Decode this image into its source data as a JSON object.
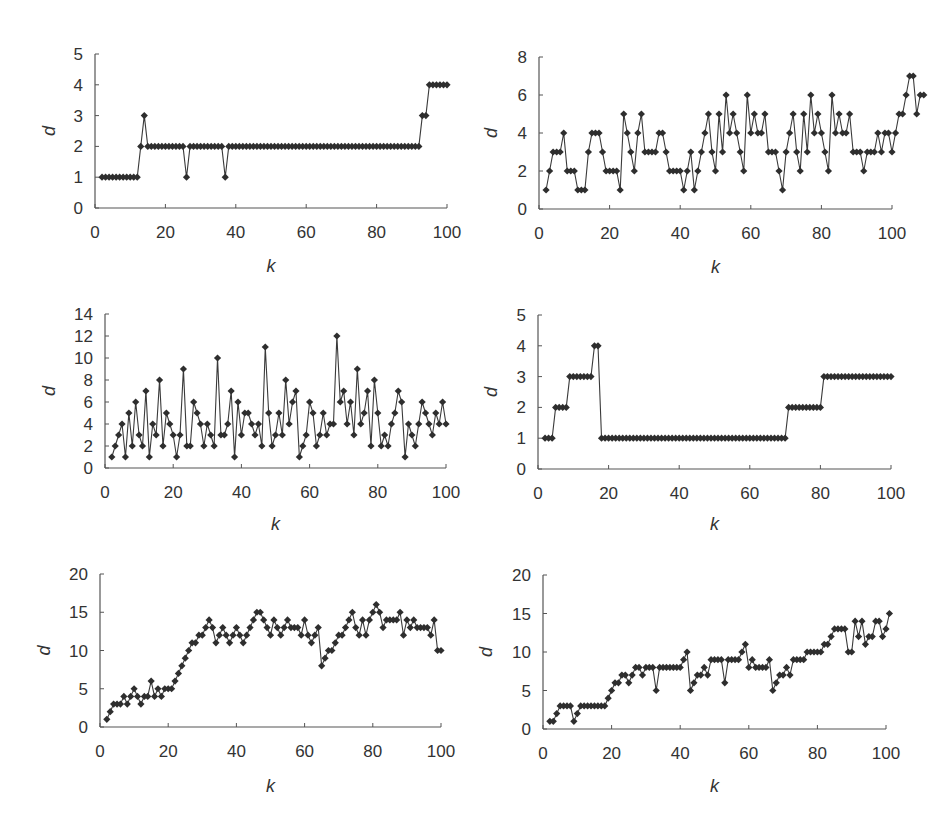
{
  "figure": {
    "background": "#ffffff",
    "line_color": "#3a3a3a",
    "marker_color": "#2e2e2e",
    "axis_color": "#555555"
  },
  "chart_data": [
    {
      "id": "panel-1",
      "type": "line",
      "title": "",
      "xlabel": "k",
      "ylabel": "d",
      "xlim": [
        0,
        100
      ],
      "ylim": [
        0,
        5
      ],
      "xticks": [
        0,
        20,
        40,
        60,
        80,
        100
      ],
      "yticks": [
        0,
        1,
        2,
        3,
        4,
        5
      ],
      "grid": false,
      "legend": null,
      "marker": "diamond",
      "x_start": 2,
      "values": [
        1,
        1,
        1,
        1,
        1,
        1,
        1,
        1,
        1,
        1,
        1,
        2,
        3,
        2,
        2,
        2,
        2,
        2,
        2,
        2,
        2,
        2,
        2,
        2,
        1,
        2,
        2,
        2,
        2,
        2,
        2,
        2,
        2,
        2,
        2,
        1,
        2,
        2,
        2,
        2,
        2,
        2,
        2,
        2,
        2,
        2,
        2,
        2,
        2,
        2,
        2,
        2,
        2,
        2,
        2,
        2,
        2,
        2,
        2,
        2,
        2,
        2,
        2,
        2,
        2,
        2,
        2,
        2,
        2,
        2,
        2,
        2,
        2,
        2,
        2,
        2,
        2,
        2,
        2,
        2,
        2,
        2,
        2,
        2,
        2,
        2,
        2,
        2,
        2,
        2,
        2,
        3,
        3,
        4,
        4,
        4,
        4,
        4,
        4
      ]
    },
    {
      "id": "panel-2",
      "type": "line",
      "title": "",
      "xlabel": "k",
      "ylabel": "d",
      "xlim": [
        0,
        100
      ],
      "ylim": [
        0,
        8
      ],
      "xticks": [
        0,
        20,
        40,
        60,
        80,
        100
      ],
      "yticks": [
        0,
        2,
        4,
        6,
        8
      ],
      "grid": false,
      "legend": null,
      "marker": "diamond",
      "x_start": 2,
      "values": [
        1,
        2,
        3,
        3,
        3,
        4,
        2,
        2,
        2,
        1,
        1,
        1,
        3,
        4,
        4,
        4,
        3,
        2,
        2,
        2,
        2,
        1,
        5,
        4,
        3,
        2,
        4,
        5,
        3,
        3,
        3,
        3,
        4,
        4,
        3,
        2,
        2,
        2,
        2,
        1,
        2,
        3,
        1,
        2,
        3,
        4,
        5,
        3,
        2,
        5,
        3,
        6,
        4,
        5,
        4,
        3,
        2,
        6,
        4,
        5,
        4,
        4,
        5,
        3,
        3,
        3,
        2,
        1,
        3,
        4,
        5,
        3,
        2,
        5,
        3,
        6,
        4,
        5,
        4,
        3,
        2,
        6,
        4,
        5,
        4,
        4,
        5,
        3,
        3,
        3,
        2,
        3,
        3,
        3,
        4,
        3,
        4,
        4,
        3,
        4,
        5,
        5,
        6,
        7,
        7,
        5,
        6,
        6
      ]
    },
    {
      "id": "panel-3",
      "type": "line",
      "title": "",
      "xlabel": "k",
      "ylabel": "d",
      "xlim": [
        0,
        100
      ],
      "ylim": [
        0,
        14
      ],
      "xticks": [
        0,
        20,
        40,
        60,
        80,
        100
      ],
      "yticks": [
        0,
        2,
        4,
        6,
        8,
        10,
        12,
        14
      ],
      "grid": false,
      "legend": null,
      "marker": "diamond",
      "x_start": 2,
      "values": [
        1,
        2,
        3,
        4,
        1,
        5,
        2,
        6,
        3,
        2,
        7,
        1,
        4,
        3,
        8,
        2,
        5,
        4,
        3,
        1,
        3,
        9,
        2,
        2,
        6,
        5,
        4,
        2,
        4,
        3,
        2,
        10,
        3,
        3,
        4,
        7,
        1,
        6,
        3,
        5,
        5,
        4,
        3,
        4,
        2,
        11,
        5,
        2,
        3,
        5,
        3,
        8,
        4,
        6,
        7,
        1,
        2,
        3,
        6,
        5,
        2,
        3,
        5,
        3,
        4,
        4,
        12,
        6,
        7,
        4,
        6,
        3,
        9,
        4,
        5,
        7,
        2,
        8,
        5,
        2,
        3,
        2,
        4,
        5,
        7,
        6,
        1,
        4,
        3,
        2,
        4,
        6,
        5,
        4,
        3,
        5,
        4,
        6,
        4
      ]
    },
    {
      "id": "panel-4",
      "type": "line",
      "title": "",
      "xlabel": "k",
      "ylabel": "d",
      "xlim": [
        0,
        100
      ],
      "ylim": [
        0,
        5
      ],
      "xticks": [
        0,
        20,
        40,
        60,
        80,
        100
      ],
      "yticks": [
        0,
        1,
        2,
        3,
        4,
        5
      ],
      "grid": false,
      "legend": null,
      "marker": "diamond",
      "x_start": 2,
      "values": [
        1,
        1,
        1,
        2,
        2,
        2,
        2,
        3,
        3,
        3,
        3,
        3,
        3,
        3,
        4,
        4,
        1,
        1,
        1,
        1,
        1,
        1,
        1,
        1,
        1,
        1,
        1,
        1,
        1,
        1,
        1,
        1,
        1,
        1,
        1,
        1,
        1,
        1,
        1,
        1,
        1,
        1,
        1,
        1,
        1,
        1,
        1,
        1,
        1,
        1,
        1,
        1,
        1,
        1,
        1,
        1,
        1,
        1,
        1,
        1,
        1,
        1,
        1,
        1,
        1,
        1,
        1,
        1,
        1,
        2,
        2,
        2,
        2,
        2,
        2,
        2,
        2,
        2,
        2,
        3,
        3,
        3,
        3,
        3,
        3,
        3,
        3,
        3,
        3,
        3,
        3,
        3,
        3,
        3,
        3,
        3,
        3,
        3,
        3
      ]
    },
    {
      "id": "panel-5",
      "type": "line",
      "title": "",
      "xlabel": "k",
      "ylabel": "d",
      "xlim": [
        0,
        100
      ],
      "ylim": [
        0,
        20
      ],
      "xticks": [
        0,
        20,
        40,
        60,
        80,
        100
      ],
      "yticks": [
        0,
        5,
        10,
        15,
        20
      ],
      "grid": false,
      "legend": null,
      "marker": "diamond",
      "x_start": 2,
      "values": [
        1,
        2,
        3,
        3,
        3,
        4,
        3,
        4,
        5,
        4,
        3,
        4,
        4,
        6,
        4,
        5,
        4,
        5,
        5,
        5,
        6,
        7,
        8,
        9,
        10,
        11,
        11,
        12,
        12,
        13,
        14,
        13,
        11,
        12,
        13,
        12,
        11,
        12,
        13,
        12,
        11,
        12,
        13,
        14,
        15,
        15,
        14,
        13,
        12,
        14,
        13,
        12,
        13,
        14,
        13,
        13,
        13,
        12,
        14,
        12,
        11,
        12,
        13,
        8,
        9,
        10,
        10,
        11,
        12,
        12,
        13,
        14,
        15,
        13,
        12,
        14,
        12,
        14,
        15,
        16,
        15,
        13,
        14,
        14,
        14,
        14,
        15,
        12,
        14,
        13,
        14,
        13,
        13,
        13,
        13,
        12,
        14,
        10,
        10
      ]
    },
    {
      "id": "panel-6",
      "type": "line",
      "title": "",
      "xlabel": "k",
      "ylabel": "d",
      "xlim": [
        0,
        100
      ],
      "ylim": [
        0,
        20
      ],
      "xticks": [
        0,
        20,
        40,
        60,
        80,
        100
      ],
      "yticks": [
        0,
        5,
        10,
        15,
        20
      ],
      "grid": false,
      "legend": null,
      "marker": "diamond",
      "x_start": 2,
      "values": [
        1,
        1,
        2,
        3,
        3,
        3,
        3,
        1,
        2,
        3,
        3,
        3,
        3,
        3,
        3,
        3,
        3,
        4,
        5,
        6,
        6,
        7,
        7,
        6,
        7,
        8,
        8,
        7,
        8,
        8,
        8,
        5,
        8,
        8,
        8,
        8,
        8,
        8,
        8,
        9,
        10,
        5,
        6,
        7,
        7,
        8,
        7,
        9,
        9,
        9,
        9,
        6,
        9,
        9,
        9,
        9,
        10,
        11,
        8,
        9,
        8,
        8,
        8,
        8,
        9,
        5,
        6,
        7,
        7,
        8,
        7,
        9,
        9,
        9,
        9,
        10,
        10,
        10,
        10,
        10,
        11,
        11,
        12,
        13,
        13,
        13,
        13,
        10,
        10,
        14,
        12,
        14,
        11,
        12,
        12,
        14,
        14,
        12,
        13,
        15
      ]
    }
  ],
  "panels": [
    {
      "xlabel": "k",
      "ylabel": "d"
    },
    {
      "xlabel": "k",
      "ylabel": "d"
    },
    {
      "xlabel": "k",
      "ylabel": "d"
    },
    {
      "xlabel": "k",
      "ylabel": "d"
    },
    {
      "xlabel": "k",
      "ylabel": "d"
    },
    {
      "xlabel": "k",
      "ylabel": "d"
    }
  ]
}
